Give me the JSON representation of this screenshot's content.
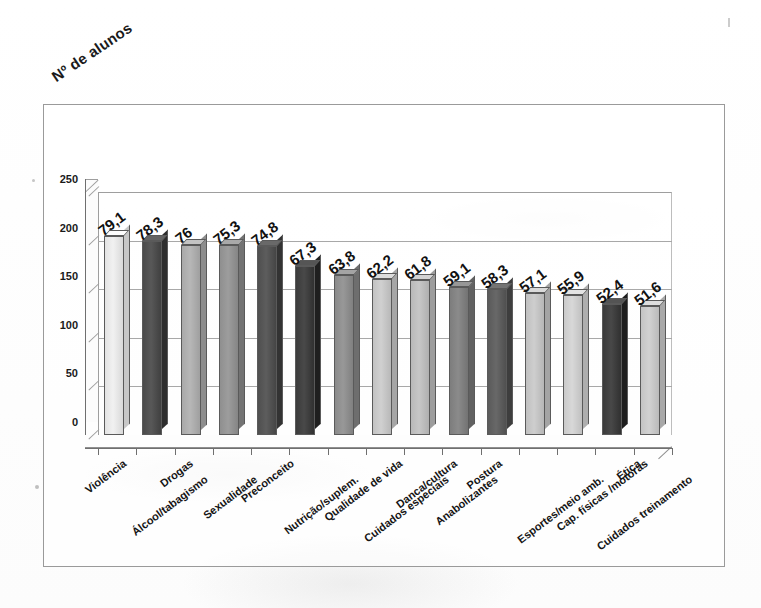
{
  "chart_data": {
    "type": "bar",
    "title": "Nº de alunos",
    "xlabel": "",
    "ylabel": "Nº de alunos",
    "ylim": [
      0,
      250
    ],
    "yticks": [
      0,
      50,
      100,
      150,
      200,
      250
    ],
    "grid": true,
    "legend": "none",
    "style": "3d-column",
    "categories": [
      "Violência",
      "Álcool/tabagismo",
      "Drogas",
      "Sexualidade",
      "Preconceito",
      "Nutrição/suplem.",
      "Qualidade de vida",
      "Cuidados especiais",
      "Danca/cultura",
      "Anabolizantes",
      "Postura",
      "Esportes/meio amb.",
      "Cap. físicas /motoras",
      "Cuidados treinamento",
      "Ética"
    ],
    "values": [
      79.1,
      78.3,
      76,
      75.3,
      74.8,
      67.3,
      63.8,
      62.2,
      61.8,
      59.1,
      58.3,
      57.1,
      55.9,
      52.4,
      51.6
    ],
    "value_labels": [
      "79,1",
      "78,3",
      "76",
      "75,3",
      "74,8",
      "67,3",
      "63,8",
      "62,2",
      "61,8",
      "59,1",
      "58,3",
      "57,1",
      "55,9",
      "52,4",
      "51,6"
    ],
    "bar_pixel_heights": [
      205,
      200,
      196,
      195,
      194,
      174,
      165,
      160,
      159,
      152,
      150,
      146,
      144,
      135,
      133
    ],
    "bar_colors": [
      "#e3e3e3",
      "#4a4a4a",
      "#a9a9a9",
      "#8f8f8f",
      "#4f4f4f",
      "#3b3b3b",
      "#8a8a8a",
      "#c2c2c2",
      "#b9b9b9",
      "#7d7d7d",
      "#5a5a5a",
      "#c0c0c0",
      "#cacaca",
      "#3a3a3a",
      "#c4c4c4"
    ]
  },
  "axis": {
    "y_tick_labels": [
      "250",
      "200",
      "150",
      "100",
      "50",
      "0"
    ]
  }
}
